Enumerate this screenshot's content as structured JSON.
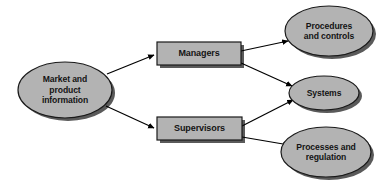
{
  "diagram": {
    "type": "flowchart",
    "colors": {
      "shape_fill": "#b3b3b3",
      "shape_stroke": "#1a1a1a",
      "shadow": "#5a5a5a",
      "arrow": "#000000",
      "background": "#ffffff",
      "text": "#141414"
    },
    "nodes": [
      {
        "id": "market-and-product-information",
        "shape": "ellipse",
        "label": "Market and\nproduct\ninformation",
        "cx": 65,
        "cy": 90,
        "rx": 47,
        "ry": 28
      },
      {
        "id": "managers",
        "shape": "rectangle",
        "label": "Managers",
        "x": 157,
        "y": 42,
        "width": 84,
        "height": 23
      },
      {
        "id": "supervisors",
        "shape": "rectangle",
        "label": "Supervisors",
        "x": 157,
        "y": 117,
        "width": 85,
        "height": 23
      },
      {
        "id": "procedures-and-controls",
        "shape": "ellipse",
        "label": "Procedures\nand controls",
        "cx": 329,
        "cy": 31,
        "rx": 44,
        "ry": 25
      },
      {
        "id": "systems",
        "shape": "ellipse",
        "label": "Systems",
        "cx": 324,
        "cy": 93,
        "rx": 35,
        "ry": 17
      },
      {
        "id": "processes-and-regulation",
        "shape": "ellipse",
        "label": "Processes and\nregulation",
        "cx": 326,
        "cy": 152,
        "rx": 45,
        "ry": 25
      }
    ],
    "edges": [
      {
        "id": "market-to-managers",
        "from": "market-and-product-information",
        "to": "managers",
        "x1": 107,
        "y1": 74,
        "x2": 154,
        "y2": 55
      },
      {
        "id": "market-to-supervisors",
        "from": "market-and-product-information",
        "to": "supervisors",
        "x1": 106,
        "y1": 106,
        "x2": 154,
        "y2": 128
      },
      {
        "id": "managers-to-procedures",
        "from": "managers",
        "to": "procedures-and-controls",
        "x1": 241,
        "y1": 51,
        "x2": 288,
        "y2": 41
      },
      {
        "id": "managers-to-systems",
        "from": "managers",
        "to": "systems",
        "x1": 241,
        "y1": 63,
        "x2": 292,
        "y2": 86
      },
      {
        "id": "supervisors-to-systems",
        "from": "supervisors",
        "to": "systems",
        "x1": 242,
        "y1": 126,
        "x2": 293,
        "y2": 100
      },
      {
        "id": "supervisors-to-processes",
        "from": "supervisors",
        "to": "processes-and-regulation",
        "x1": 242,
        "y1": 137,
        "x2": 289,
        "y2": 145
      }
    ]
  }
}
